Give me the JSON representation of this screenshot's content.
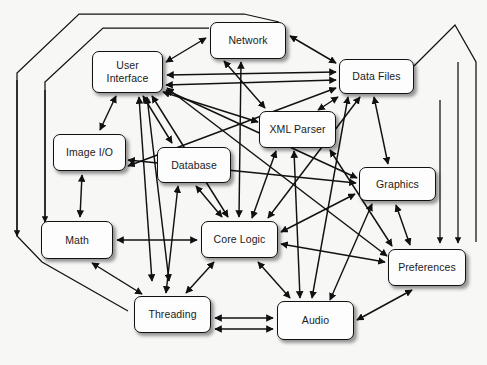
{
  "diagram": {
    "type": "node-link-graph",
    "background_color": "#f7f7f6",
    "node_fill_color": "#fdfdfd",
    "node_border_color": "#111111",
    "edge_color": "#111111",
    "nodes": [
      {
        "id": "network",
        "label": "Network",
        "x": 210,
        "y": 22,
        "w": 76,
        "h": 37
      },
      {
        "id": "user-interface",
        "label": "User\nInterface",
        "x": 92,
        "y": 51,
        "w": 71,
        "h": 42
      },
      {
        "id": "data-files",
        "label": "Data Files",
        "x": 339,
        "y": 59,
        "w": 75,
        "h": 35
      },
      {
        "id": "xml-parser",
        "label": "XML Parser",
        "x": 259,
        "y": 111,
        "w": 77,
        "h": 37
      },
      {
        "id": "image-io",
        "label": "Image I/O",
        "x": 53,
        "y": 134,
        "w": 73,
        "h": 37
      },
      {
        "id": "database",
        "label": "Database",
        "x": 157,
        "y": 147,
        "w": 74,
        "h": 36
      },
      {
        "id": "graphics",
        "label": "Graphics",
        "x": 359,
        "y": 167,
        "w": 77,
        "h": 34
      },
      {
        "id": "math",
        "label": "Math",
        "x": 41,
        "y": 221,
        "w": 72,
        "h": 38
      },
      {
        "id": "core-logic",
        "label": "Core Logic",
        "x": 201,
        "y": 221,
        "w": 77,
        "h": 37
      },
      {
        "id": "preferences",
        "label": "Preferences",
        "x": 388,
        "y": 249,
        "w": 78,
        "h": 37
      },
      {
        "id": "threading",
        "label": "Threading",
        "x": 134,
        "y": 296,
        "w": 77,
        "h": 37
      },
      {
        "id": "audio",
        "label": "Audio",
        "x": 277,
        "y": 301,
        "w": 77,
        "h": 39
      }
    ],
    "edges": [
      {
        "from": "user-interface",
        "to": "network",
        "arrow": "both"
      },
      {
        "from": "network",
        "to": "data-files",
        "arrow": "both"
      },
      {
        "from": "user-interface",
        "to": "data-files",
        "arrow": "both"
      },
      {
        "from": "user-interface",
        "to": "image-io",
        "arrow": "both"
      },
      {
        "from": "user-interface",
        "to": "database",
        "arrow": "both"
      },
      {
        "from": "user-interface",
        "to": "core-logic",
        "arrow": "both"
      },
      {
        "from": "user-interface",
        "to": "xml-parser",
        "arrow": "both"
      },
      {
        "from": "user-interface",
        "to": "graphics",
        "arrow": "both"
      },
      {
        "from": "user-interface",
        "to": "threading",
        "arrow": "both"
      },
      {
        "from": "user-interface",
        "to": "preferences",
        "arrow": "both"
      },
      {
        "from": "network",
        "to": "core-logic",
        "arrow": "both"
      },
      {
        "from": "network",
        "to": "xml-parser",
        "arrow": "both"
      },
      {
        "from": "data-files",
        "to": "xml-parser",
        "arrow": "both"
      },
      {
        "from": "data-files",
        "to": "graphics",
        "arrow": "both"
      },
      {
        "from": "data-files",
        "to": "core-logic",
        "arrow": "both"
      },
      {
        "from": "data-files",
        "to": "audio",
        "arrow": "both"
      },
      {
        "from": "data-files",
        "to": "image-io",
        "arrow": "both"
      },
      {
        "from": "xml-parser",
        "to": "core-logic",
        "arrow": "both"
      },
      {
        "from": "xml-parser",
        "to": "preferences",
        "arrow": "both"
      },
      {
        "from": "xml-parser",
        "to": "audio",
        "arrow": "both"
      },
      {
        "from": "image-io",
        "to": "math",
        "arrow": "both"
      },
      {
        "from": "image-io",
        "to": "graphics",
        "arrow": "both"
      },
      {
        "from": "database",
        "to": "core-logic",
        "arrow": "both"
      },
      {
        "from": "database",
        "to": "threading",
        "arrow": "both"
      },
      {
        "from": "math",
        "to": "core-logic",
        "arrow": "both"
      },
      {
        "from": "math",
        "to": "threading",
        "arrow": "both"
      },
      {
        "from": "core-logic",
        "to": "threading",
        "arrow": "both"
      },
      {
        "from": "core-logic",
        "to": "audio",
        "arrow": "both"
      },
      {
        "from": "core-logic",
        "to": "graphics",
        "arrow": "both"
      },
      {
        "from": "core-logic",
        "to": "preferences",
        "arrow": "both"
      },
      {
        "from": "graphics",
        "to": "audio",
        "arrow": "both"
      },
      {
        "from": "graphics",
        "to": "preferences",
        "arrow": "both"
      },
      {
        "from": "threading",
        "to": "audio",
        "arrow": "both"
      },
      {
        "from": "audio",
        "to": "preferences",
        "arrow": "both"
      }
    ]
  }
}
